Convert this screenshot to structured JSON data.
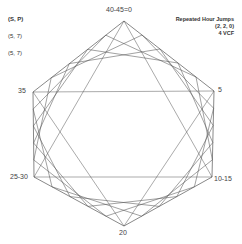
{
  "legend": {
    "items": [
      "(S, P)",
      "(5, 7)",
      "(5, 7)"
    ]
  },
  "title": {
    "line1": "Repeated Hour Jumps",
    "line2": "(2, 2, 0)",
    "line3": "4 VCF"
  },
  "vertices": [
    {
      "label": "40-45=0",
      "x": 124,
      "y": 21,
      "lx": 106,
      "ly": 6
    },
    {
      "label": "5",
      "x": 214,
      "y": 91,
      "lx": 218,
      "ly": 86
    },
    {
      "label": "10-15",
      "x": 212,
      "y": 177,
      "lx": 214,
      "ly": 175
    },
    {
      "label": "20",
      "x": 124,
      "y": 226,
      "lx": 119,
      "ly": 229
    },
    {
      "label": "25-30",
      "x": 34,
      "y": 177,
      "lx": 10,
      "ly": 173
    },
    {
      "label": "35",
      "x": 33,
      "y": 92,
      "lx": 18,
      "ly": 87
    }
  ],
  "style": {
    "line_color": "#555555",
    "steps": 5
  }
}
